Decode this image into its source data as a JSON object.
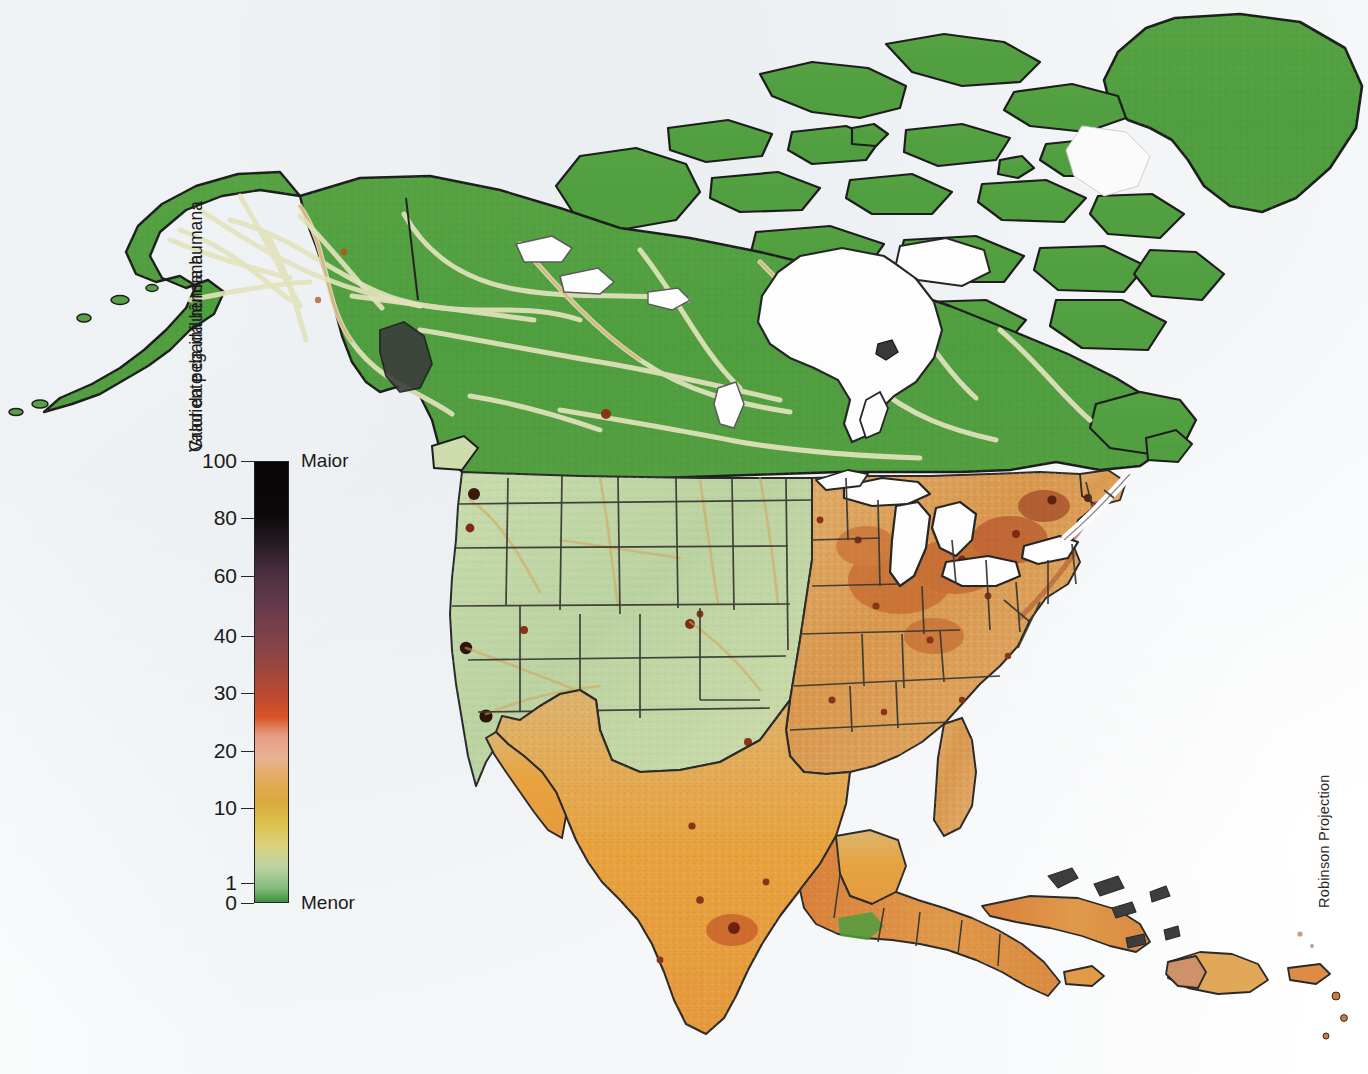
{
  "map": {
    "title": "Human Footprint / Pegada Humana — North America",
    "projection_note": "Robinson Projection",
    "ocean_color": "#ffffff",
    "coastline_color": "#1d1d1d",
    "border_color": "#3a3a34",
    "regions": [
      {
        "name": "greenland",
        "label": "Greenland",
        "fill": "#4f9e3f"
      },
      {
        "name": "canada",
        "label": "Canada",
        "fill": "#4f9e3f"
      },
      {
        "name": "alaska",
        "label": "Alaska",
        "fill": "#4f9e3f"
      },
      {
        "name": "western-united-states",
        "label": "Western United States",
        "fill": "#bdd4a6"
      },
      {
        "name": "eastern-united-states",
        "label": "Eastern United States",
        "fill": "#dfa765"
      },
      {
        "name": "mexico",
        "label": "Mexico",
        "fill": "#e8a33f"
      },
      {
        "name": "central-america",
        "label": "Central America",
        "fill": "#e09a4a"
      },
      {
        "name": "caribbean",
        "label": "Caribbean Islands",
        "fill": "#dd8b45"
      }
    ],
    "water_bodies": [
      {
        "name": "hudson-bay",
        "label": "Hudson Bay"
      },
      {
        "name": "great-lakes",
        "label": "Great Lakes"
      },
      {
        "name": "gulf-of-mexico",
        "label": "Gulf of Mexico"
      },
      {
        "name": "baffin-bay",
        "label": "Baffin Bay"
      }
    ]
  },
  "legend": {
    "title_left": "Valor da pegada humana",
    "title_right": "Gradiente da influência humana",
    "high_label": "Maior",
    "low_label": "Menor",
    "scale": {
      "type": "continuous",
      "min": 0,
      "max": 100,
      "ticks": [
        {
          "value": 100,
          "label": "100",
          "pos_pct": 0.0
        },
        {
          "value": 80,
          "label": "80",
          "pos_pct": 13.0
        },
        {
          "value": 60,
          "label": "60",
          "pos_pct": 26.0
        },
        {
          "value": 40,
          "label": "40",
          "pos_pct": 39.5
        },
        {
          "value": 30,
          "label": "30",
          "pos_pct": 52.5
        },
        {
          "value": 20,
          "label": "20",
          "pos_pct": 65.5
        },
        {
          "value": 10,
          "label": "10",
          "pos_pct": 78.5
        },
        {
          "value": 1,
          "label": "1",
          "pos_pct": 95.5
        },
        {
          "value": 0,
          "label": "0",
          "pos_pct": 100.0
        }
      ],
      "color_stops": [
        {
          "value": 100,
          "color": "#090607"
        },
        {
          "value": 88,
          "color": "#0c0809"
        },
        {
          "value": 82,
          "color": "#231a20"
        },
        {
          "value": 75,
          "color": "#4a2f40"
        },
        {
          "value": 66,
          "color": "#6b3c4c"
        },
        {
          "value": 56,
          "color": "#8d4646"
        },
        {
          "value": 47,
          "color": "#bb4a30"
        },
        {
          "value": 42,
          "color": "#da5526"
        },
        {
          "value": 38,
          "color": "#e59b7f"
        },
        {
          "value": 33,
          "color": "#e8b295"
        },
        {
          "value": 28,
          "color": "#e2ab5e"
        },
        {
          "value": 23,
          "color": "#dca83f"
        },
        {
          "value": 18,
          "color": "#dcc049"
        },
        {
          "value": 13,
          "color": "#ddd07c"
        },
        {
          "value": 8,
          "color": "#bcd3a4"
        },
        {
          "value": 3,
          "color": "#82bb7b"
        },
        {
          "value": 0,
          "color": "#3e8f3c"
        }
      ]
    }
  }
}
